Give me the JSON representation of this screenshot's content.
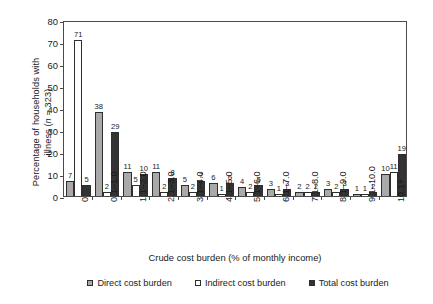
{
  "chart_data": {
    "type": "bar",
    "title": "",
    "xlabel": "Crude cost burden (% of monthly income)",
    "ylabel_line1": "Percentage of households with",
    "ylabel_line2": "illness (n = 323)",
    "ylim": [
      0,
      80
    ],
    "yticks": [
      0,
      10,
      20,
      30,
      40,
      50,
      60,
      70,
      80
    ],
    "grid": false,
    "legend_position": "bottom",
    "categories": [
      "0",
      "0.1–1.0",
      "1.1–2.0",
      "2.1–3.0",
      "3.1–4.0",
      "4.1–5.0",
      "5.1–6.0",
      "6.1–7.0",
      "7.1–8.0",
      "8.1–9.0",
      "9.1–10.0",
      "10.1+"
    ],
    "series": [
      {
        "name": "Direct cost burden",
        "color": "#a9a9a9",
        "values": [
          7,
          38,
          11,
          11,
          5,
          6,
          4,
          3,
          2,
          3,
          1,
          10
        ]
      },
      {
        "name": "Indirect cost burden",
        "color": "#ffffff",
        "values": [
          71,
          2,
          5,
          2,
          2,
          1,
          2,
          1,
          2,
          2,
          1,
          11
        ]
      },
      {
        "name": "Total cost burden",
        "color": "#333333",
        "values": [
          5,
          29,
          10,
          8,
          7,
          6,
          5,
          3,
          2,
          3,
          2,
          19
        ]
      }
    ]
  },
  "legend": {
    "items": [
      {
        "label": "Direct cost burden",
        "color": "#a9a9a9"
      },
      {
        "label": "Indirect cost burden",
        "color": "#ffffff"
      },
      {
        "label": "Total cost burden",
        "color": "#333333"
      }
    ]
  }
}
